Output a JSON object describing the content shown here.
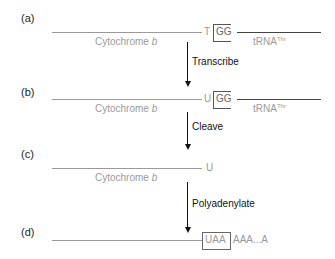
{
  "steps": [
    {
      "label": "(a)",
      "gene": "Cytochrome b",
      "junction": "T",
      "boxed": "GG",
      "trna": "tRNA",
      "trna_sup": "Thr"
    },
    {
      "label": "(b)",
      "gene": "Cytochrome b",
      "junction": "U",
      "boxed": "GG",
      "trna": "tRNA",
      "trna_sup": "Thr"
    },
    {
      "label": "(c)",
      "gene": "Cytochrome b",
      "junction": "U"
    },
    {
      "label": "(d)",
      "boxed": "UAA",
      "tail": "AAA...A"
    }
  ],
  "actions": [
    "Transcribe",
    "Cleave",
    "Polyadenylate"
  ]
}
